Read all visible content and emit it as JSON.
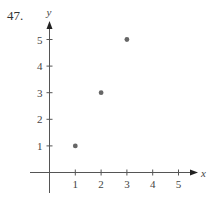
{
  "problem_number": "47.",
  "chart_data": {
    "type": "scatter",
    "title": "",
    "xlabel": "x",
    "ylabel": "y",
    "x": [
      1,
      2,
      3
    ],
    "y": [
      1,
      3,
      5
    ],
    "points": [
      [
        1,
        1
      ],
      [
        2,
        3
      ],
      [
        3,
        5
      ]
    ],
    "xticks": [
      "1",
      "2",
      "3",
      "4",
      "5"
    ],
    "yticks": [
      "1",
      "2",
      "3",
      "4",
      "5"
    ],
    "xlim": [
      -0.2,
      5.6
    ],
    "ylim": [
      -0.8,
      5.8
    ],
    "grid": false,
    "legend": null,
    "point_color": "#666666",
    "axis_color": "#555555"
  }
}
